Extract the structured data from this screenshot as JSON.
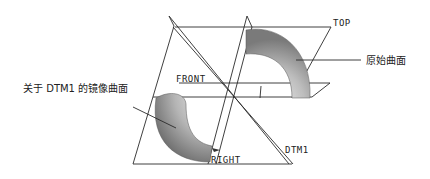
{
  "figure": {
    "colors": {
      "background": "#ffffff",
      "line": "#2a2a2a",
      "surface_light": "#d8d8d8",
      "surface_dark": "#6e6e6e"
    }
  },
  "labels": {
    "top": "TOP",
    "front": "FRONT",
    "right": "RIGHT",
    "dtm1": "DTM1",
    "original_surface": "原始曲面",
    "mirrored_surface": "关于 DTM1 的镜像曲面"
  },
  "datum_planes": [
    {
      "name": "TOP",
      "role": "datum-plane"
    },
    {
      "name": "FRONT",
      "role": "datum-plane"
    },
    {
      "name": "RIGHT",
      "role": "datum-plane"
    },
    {
      "name": "DTM1",
      "role": "mirror-plane"
    }
  ],
  "surfaces": [
    {
      "name": "原始曲面",
      "role": "original"
    },
    {
      "name": "关于 DTM1 的镜像曲面",
      "role": "mirrored"
    }
  ]
}
